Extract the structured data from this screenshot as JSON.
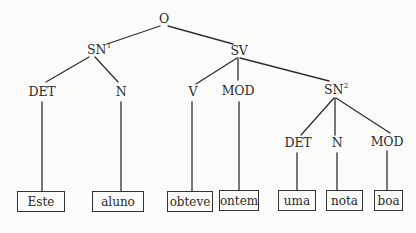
{
  "diagram": {
    "type": "syntax-tree",
    "colors": {
      "ink": "#2a2a2a",
      "background": "#fbfbfa"
    },
    "nodes": {
      "O": {
        "label": "O"
      },
      "SN1": {
        "label": "SN",
        "sup": "1"
      },
      "SV": {
        "label": "SV"
      },
      "DET1": {
        "label": "DET"
      },
      "N1": {
        "label": "N"
      },
      "V": {
        "label": "V"
      },
      "MOD1": {
        "label": "MOD"
      },
      "SN2": {
        "label": "SN",
        "sup": "2"
      },
      "DET2": {
        "label": "DET"
      },
      "N2": {
        "label": "N"
      },
      "MOD2": {
        "label": "MOD"
      }
    },
    "leaves": [
      {
        "word": "Este",
        "parent": "DET1"
      },
      {
        "word": "aluno",
        "parent": "N1"
      },
      {
        "word": "obteve",
        "parent": "V"
      },
      {
        "word": "ontem",
        "parent": "MOD1"
      },
      {
        "word": "uma",
        "parent": "DET2"
      },
      {
        "word": "nota",
        "parent": "N2"
      },
      {
        "word": "boa",
        "parent": "MOD2"
      }
    ],
    "edges": [
      [
        "O",
        "SN1"
      ],
      [
        "O",
        "SV"
      ],
      [
        "SN1",
        "DET1"
      ],
      [
        "SN1",
        "N1"
      ],
      [
        "SV",
        "V"
      ],
      [
        "SV",
        "MOD1"
      ],
      [
        "SV",
        "SN2"
      ],
      [
        "SN2",
        "DET2"
      ],
      [
        "SN2",
        "N2"
      ],
      [
        "SN2",
        "MOD2"
      ]
    ]
  }
}
